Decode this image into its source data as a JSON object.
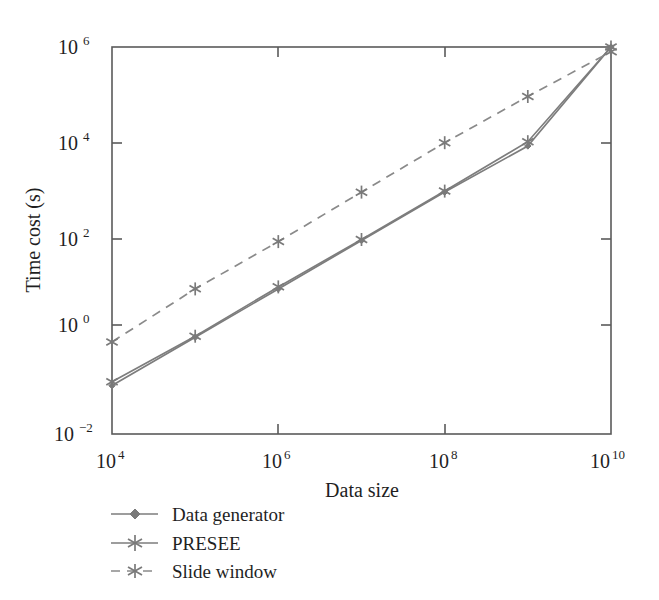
{
  "chart_data": {
    "type": "line",
    "title": "",
    "xlabel": "Data size",
    "ylabel": "Time cost (s)",
    "xscale": "log",
    "yscale": "log",
    "xlim": [
      10000,
      10000000000
    ],
    "ylim": [
      0.01,
      1000000
    ],
    "x": [
      10000,
      100000,
      1000000,
      10000000,
      100000000,
      1000000000,
      10000000000
    ],
    "xtick_labels": [
      "10⁴",
      "10⁶",
      "10⁸",
      "10¹⁰"
    ],
    "xtick_bases": [
      "10",
      "10",
      "10",
      "10"
    ],
    "xtick_exponents": [
      "4",
      "6",
      "8",
      "10"
    ],
    "xtick_values": [
      10000,
      1000000,
      100000000,
      10000000000
    ],
    "ytick_labels": [
      "10⁶",
      "10⁴",
      "10²",
      "10⁰",
      "10⁻²"
    ],
    "ytick_bases": [
      "10",
      "10",
      "10",
      "10",
      "10"
    ],
    "ytick_exponents": [
      "6",
      "4",
      "2",
      "0",
      "−2"
    ],
    "ytick_values": [
      1000000,
      10000,
      100,
      1,
      0.01
    ],
    "grid": false,
    "legend_position": "below-left",
    "series": [
      {
        "name": "Data generator",
        "style": "solid",
        "marker": "diamond",
        "color": "#7a7a7a",
        "values": [
          0.1,
          1.0,
          10.0,
          100.0,
          1000.0,
          9000.0,
          1000000.0
        ]
      },
      {
        "name": "PRESEE",
        "style": "solid",
        "marker": "asterisk",
        "color": "#7a7a7a",
        "values": [
          0.12,
          1.05,
          11.0,
          105.0,
          1050.0,
          11000.0,
          1000000.0
        ]
      },
      {
        "name": "Slide window",
        "style": "dashed",
        "marker": "x-star",
        "color": "#8a8a8a",
        "values": [
          0.8,
          10.0,
          95.0,
          1000.0,
          10500.0,
          95000.0,
          800000.0
        ]
      }
    ]
  },
  "legend": {
    "items": [
      {
        "label": "Data generator",
        "marker": "diamond",
        "style": "solid"
      },
      {
        "label": "PRESEE",
        "marker": "asterisk",
        "style": "solid"
      },
      {
        "label": "Slide window",
        "marker": "x-star",
        "style": "dashed"
      }
    ]
  }
}
